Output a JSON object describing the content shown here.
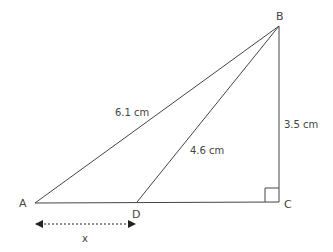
{
  "diagram": {
    "points": {
      "A": {
        "label": "A"
      },
      "B": {
        "label": "B"
      },
      "C": {
        "label": "C"
      },
      "D": {
        "label": "D"
      }
    },
    "measurements": {
      "AB": "6.1 cm",
      "BD": "4.6 cm",
      "BC": "3.5 cm",
      "AD": "x"
    },
    "right_angle_at": "C",
    "colors": {
      "line": "#444444",
      "text": "#444444"
    }
  }
}
